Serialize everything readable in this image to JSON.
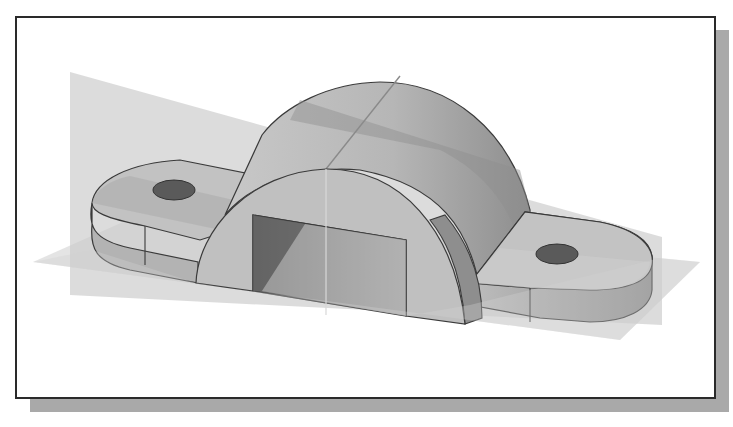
{
  "figure": {
    "frame": {
      "border_color": "#2a2a2a",
      "background": "#ffffff",
      "shadow_color": "#a9a9a9"
    }
  },
  "model": {
    "name": "saddle-bracket",
    "features": [
      "base-lug-left",
      "base-lug-right",
      "half-cylinder-arch",
      "rectangular-cutout",
      "hole-left",
      "hole-right"
    ],
    "colors": {
      "face_light": "#c4c4c4",
      "face_mid": "#b2b2b2",
      "face_dark": "#8f8f8f",
      "hole": "#5a5a5a",
      "edge": "#3a3a3a"
    }
  },
  "datum_planes": [
    {
      "name": "vertical-plane",
      "color": "#bdbdbd",
      "opacity": 0.55
    },
    {
      "name": "horizontal-plane",
      "color": "#c8c8c8",
      "opacity": 0.55
    }
  ]
}
